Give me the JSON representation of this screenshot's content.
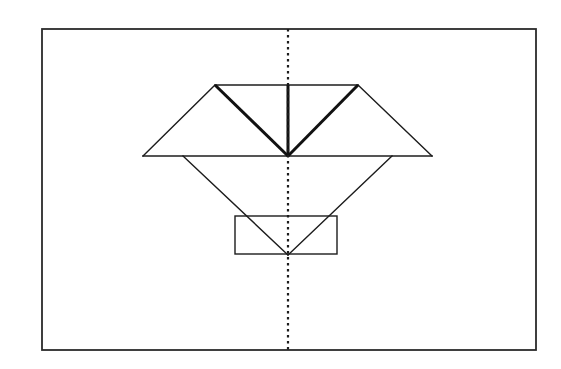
{
  "figure": {
    "background_color": "#ffffff",
    "line_color": "#1c1c1c",
    "frame_color": "#2b2b2b",
    "canvas": {
      "width": 561,
      "height": 369
    },
    "frame": {
      "x1": 42,
      "y1": 29,
      "x2": 536,
      "y2": 350
    },
    "key_points": {
      "top_left_apex": [
        215,
        85
      ],
      "top_right_apex": [
        358,
        85
      ],
      "center": [
        288,
        156
      ],
      "left_wing_tip": [
        143,
        156
      ],
      "right_wing_tip": [
        432,
        156
      ],
      "lower_left_start": [
        183,
        156
      ],
      "lower_right_start": [
        392,
        156
      ],
      "bottom_vertex": [
        288,
        255
      ]
    },
    "inner_rect": {
      "x1": 235,
      "y1": 216,
      "x2": 337,
      "y2": 254
    },
    "symmetry_axis_x": 288,
    "elements": [
      {
        "name": "outer-frame-rectangle",
        "kind": "rectangle",
        "style": "solid-thin"
      },
      {
        "name": "top-horizontal-edge",
        "kind": "line",
        "style": "solid-thin",
        "from": [
          215,
          85
        ],
        "to": [
          358,
          85
        ]
      },
      {
        "name": "middle-horizontal-edge",
        "kind": "line",
        "style": "solid-thin",
        "from": [
          143,
          156
        ],
        "to": [
          432,
          156
        ]
      },
      {
        "name": "left-outer-diagonal",
        "kind": "line",
        "style": "solid-thin",
        "from": [
          215,
          85
        ],
        "to": [
          143,
          156
        ]
      },
      {
        "name": "right-outer-diagonal",
        "kind": "line",
        "style": "solid-thin",
        "from": [
          358,
          85
        ],
        "to": [
          432,
          156
        ]
      },
      {
        "name": "left-inner-crease",
        "kind": "line",
        "style": "solid-thick",
        "from": [
          215,
          85
        ],
        "to": [
          288,
          156
        ]
      },
      {
        "name": "right-inner-crease",
        "kind": "line",
        "style": "solid-thick",
        "from": [
          358,
          85
        ],
        "to": [
          288,
          156
        ]
      },
      {
        "name": "vertical-center-crease",
        "kind": "line",
        "style": "solid-thick",
        "from": [
          288,
          85
        ],
        "to": [
          288,
          156
        ]
      },
      {
        "name": "lower-left-diagonal",
        "kind": "line",
        "style": "solid-thin",
        "from": [
          183,
          156
        ],
        "to": [
          288,
          255
        ]
      },
      {
        "name": "lower-right-diagonal",
        "kind": "line",
        "style": "solid-thin",
        "from": [
          392,
          156
        ],
        "to": [
          288,
          255
        ]
      },
      {
        "name": "inner-rectangle",
        "kind": "rectangle",
        "style": "solid-thin"
      },
      {
        "name": "symmetry-axis",
        "kind": "line",
        "style": "dotted",
        "from": [
          288,
          29
        ],
        "to": [
          288,
          350
        ]
      }
    ]
  }
}
